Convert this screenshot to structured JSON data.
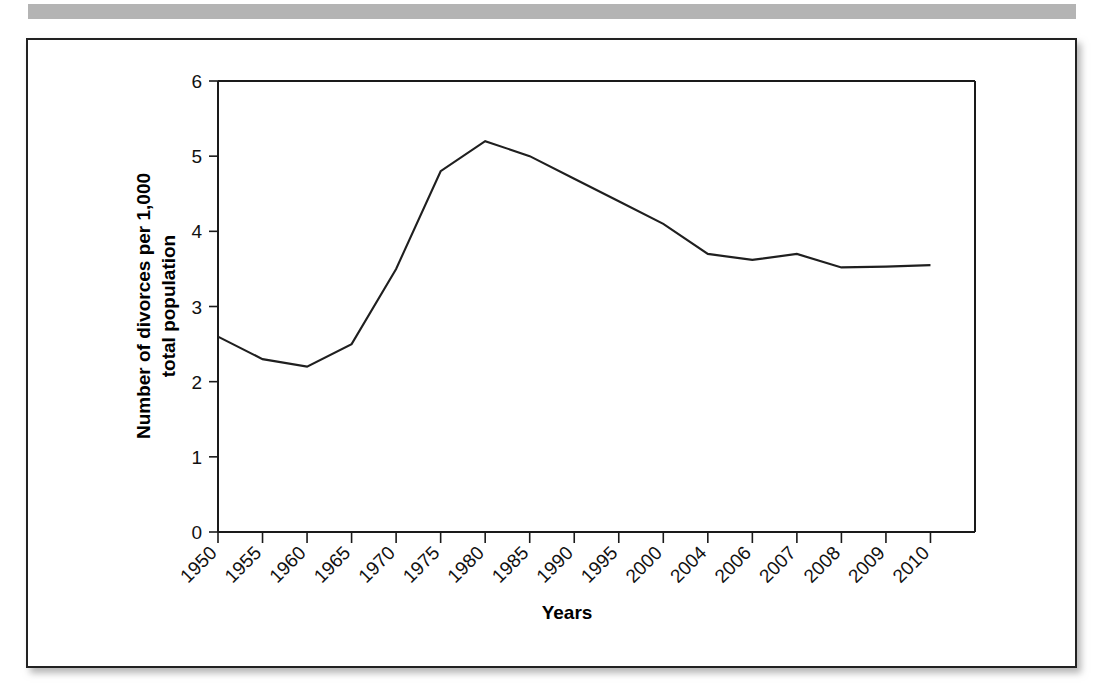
{
  "figure": {
    "background_color": "#ffffff",
    "frame_color": "#222222",
    "banner_color": "#b4b4b4",
    "line_color": "#1f1f1f"
  },
  "chart_data": {
    "type": "line",
    "title": "",
    "subtitle": "",
    "xlabel": "Years",
    "ylabel": "Number of divorces per 1,000 total population",
    "ylabel_line1": "Number of divorces per 1,000",
    "ylabel_line2": "total population",
    "categories": [
      "1950",
      "1955",
      "1960",
      "1965",
      "1970",
      "1975",
      "1980",
      "1985",
      "1990",
      "1995",
      "2000",
      "2004",
      "2006",
      "2007",
      "2008",
      "2009",
      "2010"
    ],
    "values": [
      2.6,
      2.3,
      2.2,
      2.5,
      3.5,
      4.8,
      5.2,
      5.0,
      4.7,
      4.4,
      4.1,
      3.7,
      3.62,
      3.7,
      3.52,
      3.53,
      3.55
    ],
    "series": [
      {
        "name": "Divorce rate",
        "values": [
          2.6,
          2.3,
          2.2,
          2.5,
          3.5,
          4.8,
          5.2,
          5.0,
          4.7,
          4.4,
          4.1,
          3.7,
          3.62,
          3.7,
          3.52,
          3.53,
          3.55
        ]
      }
    ],
    "ylim": [
      0,
      6
    ],
    "ytick_labels": [
      "0",
      "1",
      "2",
      "3",
      "4",
      "5",
      "6"
    ],
    "ytick_values": [
      0,
      1,
      2,
      3,
      4,
      5,
      6
    ],
    "grid": false,
    "legend": false,
    "legend_position": "none",
    "xtick_rotation": -45
  }
}
